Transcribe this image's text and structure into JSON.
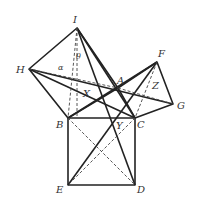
{
  "diagram": {
    "points": {
      "I": {
        "label": "I",
        "x": 77,
        "y": 28
      },
      "H": {
        "label": "H",
        "x": 29,
        "y": 69
      },
      "A": {
        "label": "A",
        "x": 118,
        "y": 88
      },
      "F": {
        "label": "F",
        "x": 157,
        "y": 62
      },
      "G": {
        "label": "G",
        "x": 173,
        "y": 104
      },
      "B": {
        "label": "B",
        "x": 68,
        "y": 118
      },
      "C": {
        "label": "C",
        "x": 135,
        "y": 118
      },
      "E": {
        "label": "E",
        "x": 68,
        "y": 185
      },
      "D": {
        "label": "D",
        "x": 135,
        "y": 185
      },
      "X": {
        "label": "X",
        "x": 88,
        "y": 95
      },
      "Y": {
        "label": "Y",
        "x": 113,
        "y": 123
      },
      "Z": {
        "label": "Z",
        "x": 155,
        "y": 85
      }
    },
    "angles": {
      "theta": "θ",
      "alpha": "α"
    },
    "line_color": "#222222",
    "dash_color": "#444444"
  }
}
